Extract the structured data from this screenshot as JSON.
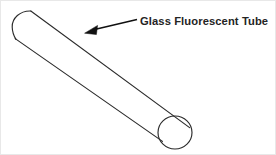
{
  "figure": {
    "background_color": "#ffffff",
    "width": 276,
    "height": 155,
    "border_color": "#e8e8e8"
  },
  "callout": {
    "label": "Glass Fluorescent Tube",
    "text_color": "#242424",
    "font_weight": "bold",
    "text_x": 140,
    "text_baseline_y": 25,
    "arrow_color": "#111111",
    "arrow_tail_x": 137,
    "arrow_tail_y": 20,
    "arrow_tip_x": 85,
    "arrow_tip_y": 33
  },
  "tube": {
    "name": "glass-fluorescent-tube",
    "line_color": "#2b2b2b",
    "fill_color": "#ffffff",
    "line_width": 1.15,
    "axis_start_x": 27,
    "axis_start_y": 25,
    "axis_end_x": 174,
    "axis_end_y": 133,
    "end_ellipse_center_x": 174,
    "end_ellipse_center_y": 133,
    "end_ellipse_rx": 17,
    "end_ellipse_ry": 16.5,
    "open_end": "lower-right",
    "capped_end": "upper-left"
  }
}
